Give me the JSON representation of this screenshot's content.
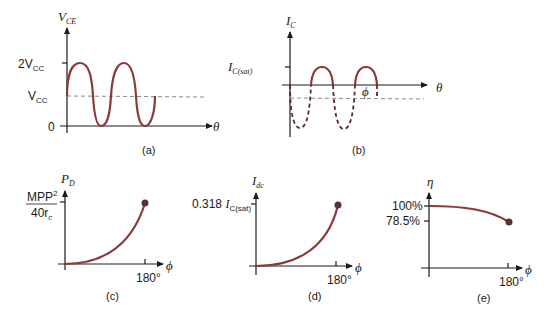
{
  "panels": {
    "a": {
      "caption": "(a)",
      "y_axis_label": "V",
      "y_axis_sub": "CE",
      "x_axis_label": "θ",
      "ticks": [
        {
          "label": "2V",
          "sub": "CC"
        },
        {
          "label": "V",
          "sub": "CC"
        },
        {
          "label": "0",
          "sub": ""
        }
      ]
    },
    "b": {
      "caption": "(b)",
      "y_axis_label": "I",
      "y_axis_sub": "C",
      "x_axis_label": "θ",
      "tick_label": "I",
      "tick_sub": "C(sat)",
      "phi_label": "ϕ"
    },
    "c": {
      "caption": "(c)",
      "y_axis_label": "P",
      "y_axis_sub": "D",
      "x_axis_label": "ϕ",
      "y_tick_numerator": "MPP",
      "y_tick_numerator_sup": "2",
      "y_tick_denominator": "40r",
      "y_tick_denominator_sub": "c",
      "x_tick": "180°"
    },
    "d": {
      "caption": "(d)",
      "y_axis_label": "I",
      "y_axis_sub": "dc",
      "x_axis_label": "ϕ",
      "y_tick_prefix": "0.318 ",
      "y_tick_label": "I",
      "y_tick_sub": "C(sat)",
      "x_tick": "180°"
    },
    "e": {
      "caption": "(e)",
      "y_axis_label": "η",
      "x_axis_label": "ϕ",
      "y_ticks": [
        "100%",
        "78.5%"
      ],
      "x_tick": "180°"
    }
  },
  "colors": {
    "curve": "#8a3a3a",
    "axis": "#1a1a1a",
    "dashed": "#8a8a8a"
  }
}
